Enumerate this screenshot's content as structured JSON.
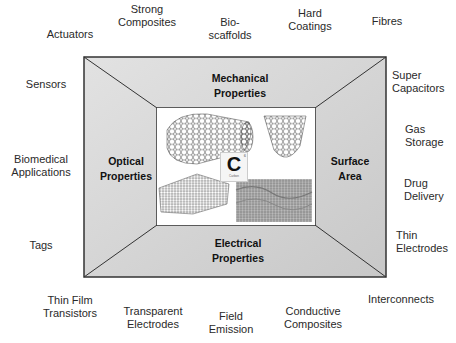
{
  "diagram": {
    "properties": {
      "top": [
        "Mechanical",
        "Properties"
      ],
      "left": [
        "Optical",
        "Properties"
      ],
      "right": [
        "Surface",
        "Area"
      ],
      "bottom": [
        "Electrical",
        "Properties"
      ]
    },
    "center": {
      "element_symbol": "C",
      "element_name": "Carbon",
      "atomic_number": "6",
      "images": [
        "nanotube-side",
        "nanotube-end",
        "nanotube-bundle",
        "graphene-sheet"
      ]
    },
    "applications": {
      "actuators": [
        "Actuators"
      ],
      "strong_composites": [
        "Strong",
        "Composites"
      ],
      "bio_scaffolds": [
        "Bio-",
        "scaffolds"
      ],
      "hard_coatings": [
        "Hard",
        "Coatings"
      ],
      "fibres": [
        "Fibres"
      ],
      "sensors": [
        "Sensors"
      ],
      "super_capacitors": [
        "Super",
        "Capacitors"
      ],
      "gas_storage": [
        "Gas",
        "Storage"
      ],
      "biomedical": [
        "Biomedical",
        "Applications"
      ],
      "drug_delivery": [
        "Drug",
        "Delivery"
      ],
      "tags": [
        "Tags"
      ],
      "thin_electrodes": [
        "Thin",
        "Electrodes"
      ],
      "thin_film_transistors": [
        "Thin Film",
        "Transistors"
      ],
      "transparent_electrodes": [
        "Transparent",
        "Electrodes"
      ],
      "field_emission": [
        "Field",
        "Emission"
      ],
      "conductive_composites": [
        "Conductive",
        "Composites"
      ],
      "interconnects": [
        "Interconnects"
      ]
    },
    "colors": {
      "frame_fill": "#d2d2d2",
      "frame_stroke": "#333333",
      "inner_fill": "#ffffff"
    }
  }
}
